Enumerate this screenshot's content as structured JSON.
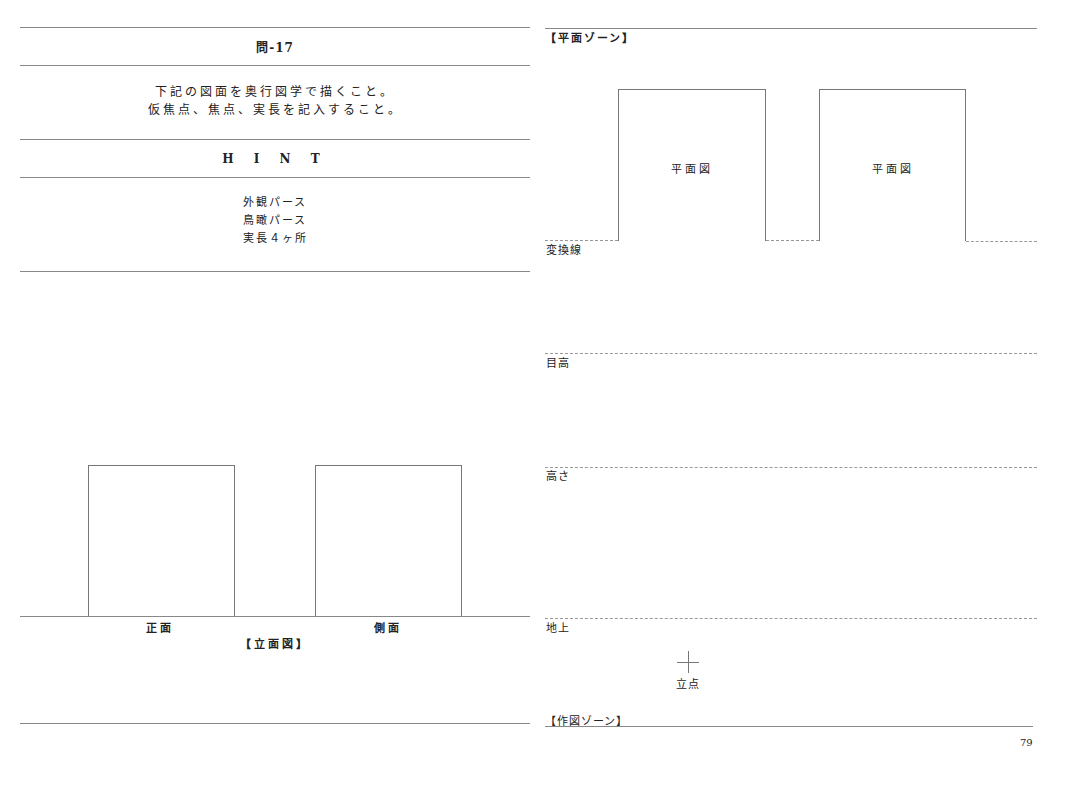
{
  "left_panel": {
    "problem_title": "問-17",
    "instructions": [
      "下記の図面を奥行図学で描くこと。",
      "仮焦点、焦点、実長を記入すること。"
    ],
    "hint_heading": "H I N T",
    "hints": [
      "外観パース",
      "鳥瞰パース",
      "実長４ヶ所"
    ],
    "elevation": {
      "front_label": "正面",
      "side_label": "側面",
      "caption": "【立面図】"
    }
  },
  "right_panel": {
    "plan_zone_label": "【平面ゾーン】",
    "plan_labels": [
      "平面図",
      "平面図"
    ],
    "lines": {
      "conversion": "変換線",
      "eye_level": "目高",
      "height": "高さ",
      "ground": "地上"
    },
    "station_point": "立点",
    "drawing_zone_label": "【作図ゾーン】",
    "page_number": "79"
  }
}
